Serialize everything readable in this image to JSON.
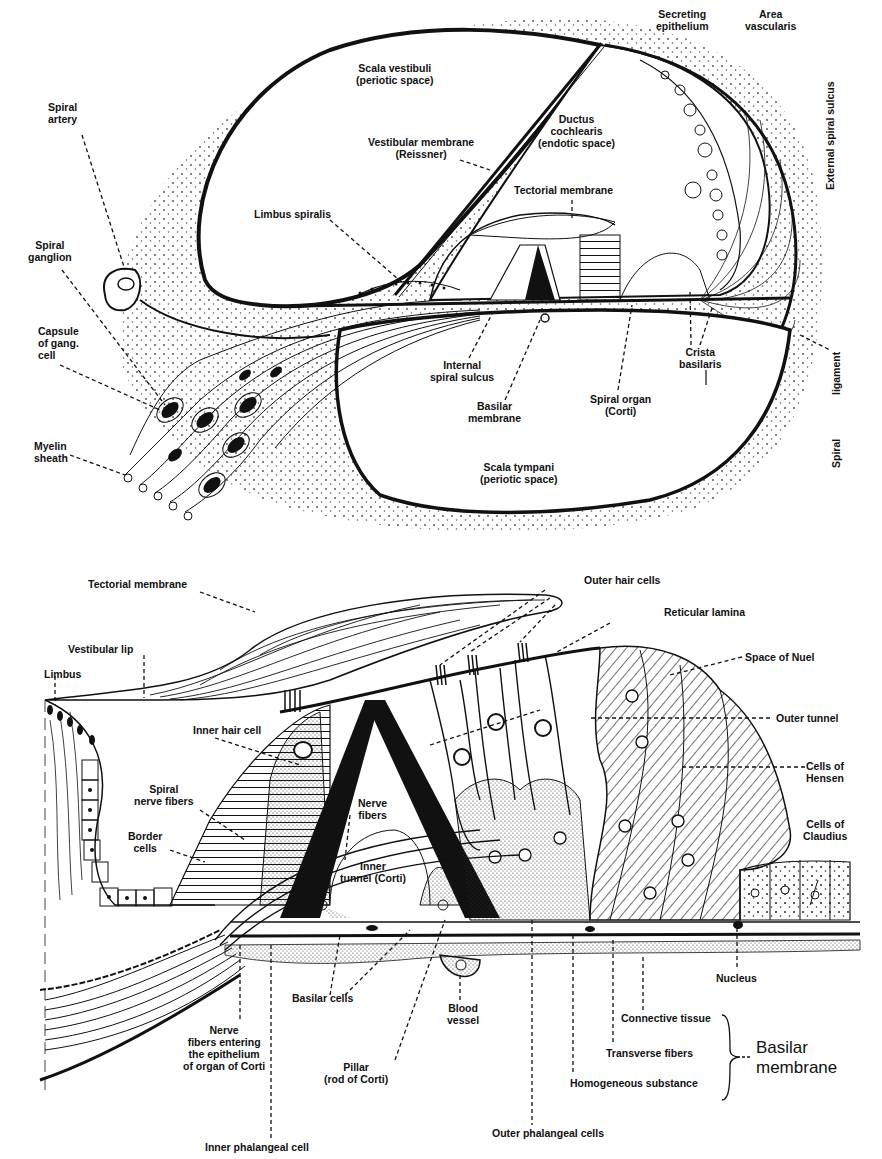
{
  "figure": {
    "panels": [
      {
        "id": "upper",
        "description": "Section through one turn of the cochlea",
        "labels": {
          "spiral_artery": "Spiral\nartery",
          "spiral_ganglion": "Spiral\nganglion",
          "capsule": "Capsule\nof gang.\ncell",
          "myelin": "Myelin\nsheath",
          "scala_vestibuli": "Scala vestibuli\n(periotic space)",
          "vestibular_membrane": "Vestibular membrane\n(Reissner)",
          "limbus_spiralis": "Limbus spiralis",
          "ductus": "Ductus\ncochlearis\n(endotic space)",
          "tectorial": "Tectorial membrane",
          "secreting": "Secreting\nepithelium",
          "area_vascularis": "Area\nvascularis",
          "external_spiral_sulcus": "External spiral sulcus",
          "internal_spiral_sulcus": "Internal\nspiral sulcus",
          "basilar_membrane": "Basilar\nmembrane",
          "spiral_organ": "Spiral organ\n(Corti)",
          "crista": "Crista\nbasilaris",
          "spiral_ligament_a": "Spiral",
          "spiral_ligament_b": "ligament",
          "scala_tympani": "Scala tympani\n(periotic space)"
        }
      },
      {
        "id": "lower",
        "description": "Detail of the spiral organ (Corti)",
        "labels": {
          "tectorial": "Tectorial membrane",
          "vestibular_lip": "Vestibular lip",
          "limbus": "Limbus",
          "inner_hair_cell": "Inner hair cell",
          "spiral_nerve_fibers": "Spiral\nnerve fibers",
          "border_cells": "Border\ncells",
          "nerve_fibers": "Nerve\nfibers",
          "inner_tunnel": "Inner\ntunnel (Corti)",
          "outer_hair_cells": "Outer hair cells",
          "reticular_lamina": "Reticular lamina",
          "space_of_nuel": "Space of Nuel",
          "outer_tunnel": "Outer tunnel",
          "hensen": "Cells of\nHensen",
          "claudius": "Cells of\nClaudius",
          "basilar_cells": "Basilar cells",
          "nucleus": "Nucleus",
          "nerve_entering": "Nerve\nfibers entering\nthe epithelium\nof organ of Corti",
          "blood_vessel": "Blood\nvessel",
          "pillar": "Pillar\n(rod of Corti)",
          "connective": "Connective tissue",
          "transverse": "Transverse fibers",
          "homogeneous": "Homogeneous substance",
          "basilar_group": "Basilar\nmembrane",
          "inner_phalangeal": "Inner phalangeal cell",
          "outer_phalangeal": "Outer phalangeal cells"
        }
      }
    ]
  }
}
